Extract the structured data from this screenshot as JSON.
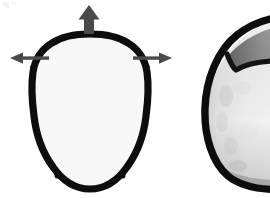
{
  "figure": {
    "title": "Superior view of infant cranium with growth-direction arrows",
    "background_color": "#ffffff",
    "width": 270,
    "height": 198
  },
  "palette": {
    "outline_black": "#0d0d0d",
    "suture_black": "#121212",
    "arrow_gray": "#4a4a4a",
    "frontal_dark": "#4f4f4f",
    "frontal_mid": "#6e6e6e",
    "highlight_white": "#f6f6f6",
    "parietal_light": "#f2f2f2",
    "parietal_mid": "#cfcfcf",
    "parietal_dark": "#9a9a9a",
    "occipital_gray": "#a8a8a8",
    "background": "#ffffff"
  },
  "specimens": [
    {
      "id": "skull-left",
      "name": "infant-cranium-superior-view",
      "view": "superior",
      "complete": true,
      "center_x": 90,
      "center_y": 112,
      "half_width": 57,
      "half_height": 79,
      "regions": [
        {
          "name": "frontal-bone-left",
          "shade": "dark-gray"
        },
        {
          "name": "frontal-bone-right",
          "shade": "dark-gray"
        },
        {
          "name": "metopic-highlight",
          "shade": "near-white"
        },
        {
          "name": "parietal-bone-left",
          "shade": "light-gradient"
        },
        {
          "name": "parietal-bone-right",
          "shade": "light-gradient"
        },
        {
          "name": "occipital-wedge",
          "shade": "mid-gray"
        }
      ],
      "sutures": [
        {
          "name": "coronal-suture",
          "orientation": "transverse"
        },
        {
          "name": "sagittal-suture",
          "orientation": "midline-longitudinal"
        },
        {
          "name": "metopic-suture",
          "orientation": "midline-anterior"
        },
        {
          "name": "lambdoid-suture",
          "orientation": "posterior-oblique"
        }
      ],
      "fontanelles": [
        {
          "name": "anterior-fontanelle",
          "x": 90,
          "y": 75
        },
        {
          "name": "posterior-fontanelle",
          "x": 90,
          "y": 172
        }
      ]
    },
    {
      "id": "skull-right",
      "name": "infant-cranium-partial-cropped",
      "view": "superior",
      "complete": false,
      "note": "cropped at right image border; only left/anterior arc visible",
      "center_x": 292,
      "center_y": 106,
      "half_width": 78,
      "half_height": 76,
      "regions": [
        {
          "name": "frontal-wedge",
          "shade": "mid-gray"
        },
        {
          "name": "parietal-bone",
          "shade": "light-gray"
        }
      ],
      "sutures": [
        {
          "name": "coronal-suture",
          "orientation": "transverse"
        }
      ]
    }
  ],
  "arrows": [
    {
      "id": "arrow-up",
      "name": "growth-arrow-superior",
      "direction": "up",
      "style": "thick-block",
      "label": "",
      "tail": {
        "x": 89,
        "y": 34
      },
      "tip": {
        "x": 89,
        "y": 5
      },
      "color": "#4a4a4a"
    },
    {
      "id": "arrow-left",
      "name": "growth-arrow-left-lateral",
      "direction": "left",
      "style": "thin-line",
      "label": "",
      "tail": {
        "x": 49,
        "y": 58
      },
      "tip": {
        "x": 10,
        "y": 58
      },
      "color": "#4a4a4a"
    },
    {
      "id": "arrow-right",
      "name": "growth-arrow-right-lateral",
      "direction": "right",
      "style": "thin-line",
      "label": "",
      "tail": {
        "x": 133,
        "y": 58
      },
      "tip": {
        "x": 172,
        "y": 58
      },
      "color": "#4a4a4a"
    }
  ],
  "artifacts": [
    {
      "id": "scan-speck-topleft",
      "name": "scan-artifact-speck",
      "x": 3,
      "y": 2,
      "width": 16,
      "height": 5,
      "color": "#ececec"
    }
  ]
}
